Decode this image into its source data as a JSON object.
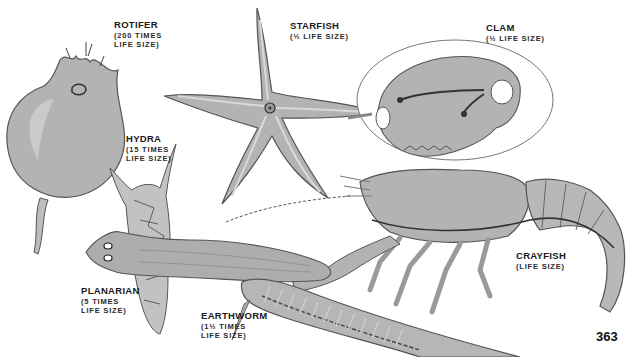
{
  "page": {
    "number": "363",
    "colors": {
      "background": "#ffffff",
      "body_fill": "#b3b3b3",
      "highlight": "#d6d6d6",
      "outline": "#4a4a4a",
      "text": "#1a1a1a"
    }
  },
  "specimens": [
    {
      "id": "rotifer",
      "name": "ROTIFER",
      "scale_line1": "(200 TIMES",
      "scale_line2": "LIFE SIZE)"
    },
    {
      "id": "starfish",
      "name": "STARFISH",
      "scale_line1": "(½ LIFE SIZE)",
      "scale_line2": ""
    },
    {
      "id": "clam",
      "name": "CLAM",
      "scale_line1": "(½ LIFE SIZE)",
      "scale_line2": ""
    },
    {
      "id": "hydra",
      "name": "HYDRA",
      "scale_line1": "(15 TIMES",
      "scale_line2": "LIFE SIZE)"
    },
    {
      "id": "crayfish",
      "name": "CRAYFISH",
      "scale_line1": "(LIFE SIZE)",
      "scale_line2": ""
    },
    {
      "id": "planarian",
      "name": "PLANARIAN",
      "scale_line1": "(5 TIMES",
      "scale_line2": "LIFE SIZE)"
    },
    {
      "id": "earthworm",
      "name": "EARTHWORM",
      "scale_line1": "(1½ TIMES",
      "scale_line2": "LIFE SIZE)"
    }
  ]
}
